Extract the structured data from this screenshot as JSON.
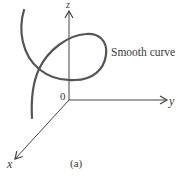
{
  "figure": {
    "caption": "(a)",
    "axes": {
      "x_label": "x",
      "y_label": "y",
      "z_label": "z",
      "origin_label": "0"
    },
    "annotation": "Smooth curve",
    "colors": {
      "curve": "#555555",
      "axis": "#444444",
      "text": "#3a3a3a",
      "background": "#ffffff"
    }
  }
}
